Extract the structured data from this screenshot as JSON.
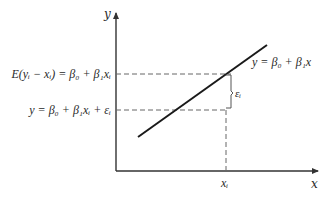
{
  "diagram": {
    "type": "simple-linear-regression-illustration",
    "axes": {
      "x_label": "x",
      "y_label": "y"
    },
    "regression_line": {
      "label": "y = β₀ + β₁x"
    },
    "annotations": {
      "expected_value_label": "E(yᵢ − xᵢ) = β₀ + β₁xᵢ",
      "observation_label": "y = β₀ + β₁xᵢ + εᵢ",
      "error_label": "εᵢ",
      "x_tick_label": "xᵢ"
    },
    "colors": {
      "line": "#1a1a1a",
      "axis": "#333333",
      "dashed": "#666666",
      "text": "#2a2a2a"
    }
  }
}
